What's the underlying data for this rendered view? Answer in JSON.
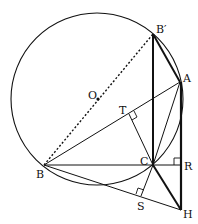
{
  "diagram": {
    "title": "",
    "circle": {
      "center": "O",
      "cx": 97,
      "cy": 99,
      "r": 86
    },
    "points": {
      "O": {
        "x": 97,
        "y": 99,
        "label": "O"
      },
      "Bp": {
        "x": 153,
        "y": 34,
        "label": "B′"
      },
      "A": {
        "x": 180,
        "y": 82,
        "label": "A"
      },
      "B": {
        "x": 44,
        "y": 165,
        "label": "B"
      },
      "C": {
        "x": 153,
        "y": 165,
        "label": "C"
      },
      "R": {
        "x": 181,
        "y": 165,
        "label": "R"
      },
      "H": {
        "x": 181,
        "y": 210,
        "label": "H"
      },
      "T": {
        "x": 129,
        "y": 114,
        "label": "T"
      },
      "S": {
        "x": 141,
        "y": 196,
        "label": "S"
      }
    },
    "segments": [
      {
        "from": "B",
        "to": "Bp",
        "style": "dotted"
      },
      {
        "from": "Bp",
        "to": "C",
        "style": "thick"
      },
      {
        "from": "Bp",
        "to": "A",
        "style": "thick"
      },
      {
        "from": "A",
        "to": "H",
        "style": "thick"
      },
      {
        "from": "C",
        "to": "H",
        "style": "thick"
      },
      {
        "from": "B",
        "to": "A",
        "style": "thin"
      },
      {
        "from": "B",
        "to": "R",
        "style": "thin"
      },
      {
        "from": "B",
        "to": "H",
        "style": "thin"
      },
      {
        "from": "C",
        "to": "T",
        "style": "thin"
      },
      {
        "from": "C",
        "to": "S",
        "style": "thin"
      },
      {
        "from": "C",
        "to": "A",
        "style": "thin"
      }
    ],
    "right_angles": [
      "T",
      "S",
      "R"
    ]
  }
}
